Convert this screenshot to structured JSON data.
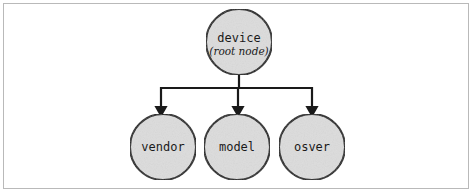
{
  "figure": {
    "background_color": "#ffffff",
    "frame_color": "#b9b9b9"
  },
  "style": {
    "node_fill": "#dcdcdc",
    "node_stroke": "#1a1a1a",
    "edge_color": "#1a1a1a"
  },
  "diagram": {
    "type": "tree",
    "root": {
      "id": "device",
      "label": "device",
      "sublabel": "(root node)",
      "cx": 239,
      "cy": 42,
      "r": 33
    },
    "children": [
      {
        "id": "vendor",
        "label": "vendor",
        "cx": 163,
        "cy": 147,
        "r": 33
      },
      {
        "id": "model",
        "label": "model",
        "cx": 237,
        "cy": 147,
        "r": 33
      },
      {
        "id": "osver",
        "label": "osver",
        "cx": 312,
        "cy": 147,
        "r": 33
      }
    ],
    "edges": [
      {
        "from": "device",
        "to": "vendor"
      },
      {
        "from": "device",
        "to": "model"
      },
      {
        "from": "device",
        "to": "osver"
      }
    ],
    "bus_y": 88
  }
}
